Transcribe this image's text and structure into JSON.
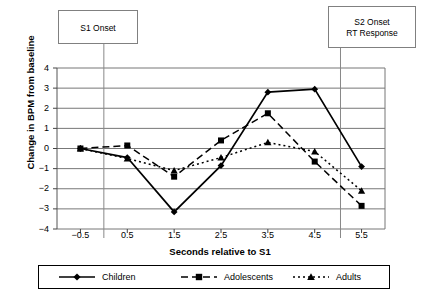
{
  "chart_data": {
    "type": "line",
    "title": "",
    "xlabel": "Seconds relative to S1",
    "ylabel": "Change in BPM from baseline",
    "x": [
      -0.5,
      0.5,
      1.5,
      2.5,
      3.5,
      4.5,
      5.5
    ],
    "xticklabels": [
      "−0.5",
      "0.5",
      "1.5",
      "2.5",
      "3.5",
      "4.5",
      "5.5"
    ],
    "yticklabels": [
      "4",
      "3",
      "2",
      "1",
      "0",
      "−1",
      "−2",
      "−3",
      "−4"
    ],
    "yticks": [
      4,
      3,
      2,
      1,
      0,
      -1,
      -2,
      -3,
      -4
    ],
    "xlim": [
      -1.0,
      6.0
    ],
    "ylim": [
      -4,
      4
    ],
    "grid": true,
    "legend_position": "below",
    "series": [
      {
        "name": "Children",
        "marker": "diamond",
        "linestyle": "solid",
        "color": "#000000",
        "values": [
          0.0,
          -0.45,
          -3.15,
          -0.85,
          2.8,
          2.95,
          -0.9
        ]
      },
      {
        "name": "Adolescents",
        "marker": "square",
        "linestyle": "dashed",
        "color": "#000000",
        "values": [
          0.0,
          0.15,
          -1.4,
          0.4,
          1.75,
          -0.65,
          -2.85
        ]
      },
      {
        "name": "Adults",
        "marker": "triangle",
        "linestyle": "dotted",
        "color": "#000000",
        "values": [
          0.0,
          -0.5,
          -1.1,
          -0.45,
          0.3,
          -0.15,
          -2.1
        ]
      }
    ],
    "annotations": [
      {
        "id": "s1",
        "line1": "S1 Onset",
        "line2": "",
        "x_value": 0.0
      },
      {
        "id": "s2",
        "line1": "S2 Onset",
        "line2": "RT Response",
        "x_value": 5.05
      }
    ]
  },
  "legend": {
    "items": [
      {
        "label": "Children"
      },
      {
        "label": "Adolescents"
      },
      {
        "label": "Adults"
      }
    ]
  }
}
